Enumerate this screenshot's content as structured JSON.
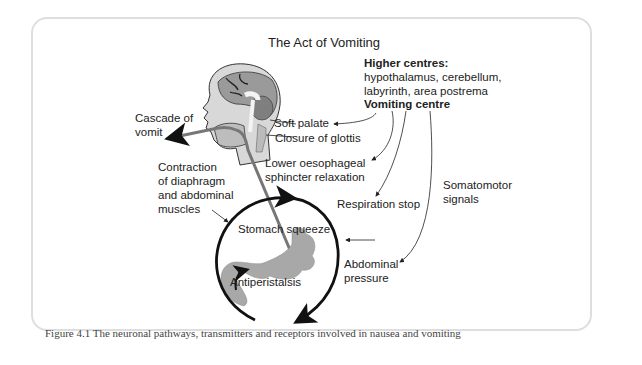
{
  "figure": {
    "title": "The Act of Vomiting",
    "caption": "Figure 4.1  The neuronal pathways, transmitters and receptors involved in nausea and vomiting"
  },
  "labels": {
    "higher_centres_heading": "Higher centres:",
    "higher_centres_line1": "hypothalamus, cerebellum,",
    "higher_centres_line2": "labyrinth, area postrema",
    "vomiting_centre": "Vomiting centre",
    "cascade_line1": "Cascade of",
    "cascade_line2": "vomit",
    "soft_palate": "Soft palate",
    "closure_glottis": "Closure of glottis",
    "les_line1": "Lower oesophageal",
    "les_line2": "sphincter relaxation",
    "contraction_line1": "Contraction",
    "contraction_line2": "of diaphragm",
    "contraction_line3": "and abdominal",
    "contraction_line4": "muscles",
    "respiration_stop": "Respiration stop",
    "somatomotor_line1": "Somatomotor",
    "somatomotor_line2": "signals",
    "stomach_squeeze": "Stomach squeeze",
    "abdominal_line1": "Abdominal",
    "abdominal_line2": "pressure",
    "antiperistalsis": "Antiperistalsis"
  },
  "colors": {
    "frame_border": "#dedede",
    "text": "#222222",
    "caption_text": "#444444",
    "organ_fill": "#a8a8a8",
    "arrow_dark": "#111111",
    "tube": "#666666"
  }
}
